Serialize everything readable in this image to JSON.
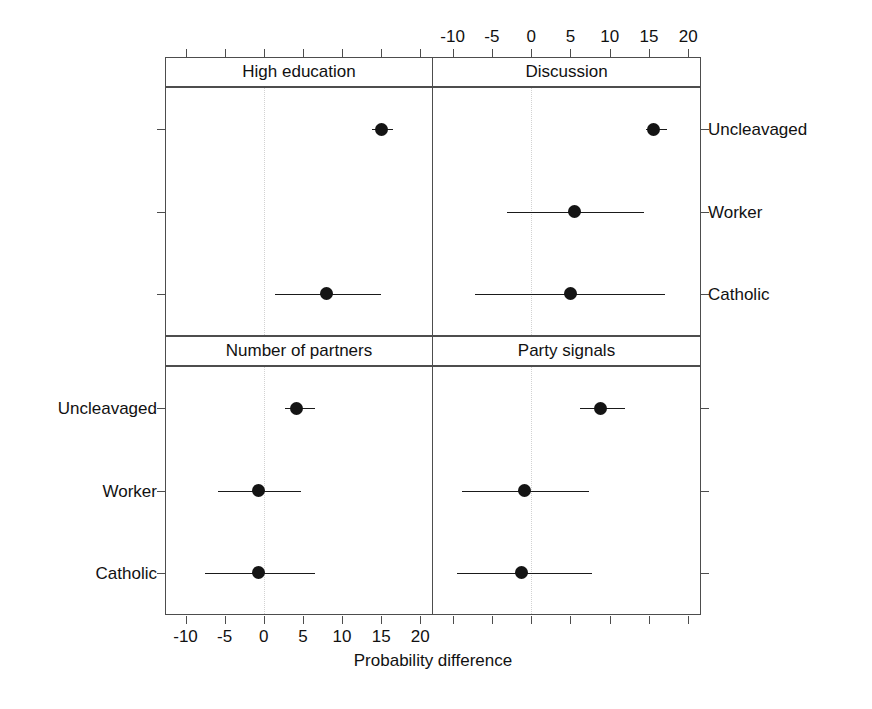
{
  "chart_data": {
    "type": "scatter",
    "plot_style": "dot-plot with horizontal confidence-interval whiskers, 2x2 trellis panels",
    "title": "",
    "xlabel": "Probability difference",
    "ylabel": "",
    "xlim": [
      -12.5,
      21.5
    ],
    "xticks": [
      -10,
      -5,
      0,
      5,
      10,
      15,
      20
    ],
    "xtick_labels": [
      "-10",
      "-5",
      "0",
      "5",
      "10",
      "15",
      "20"
    ],
    "categories": [
      "Uncleavaged",
      "Worker",
      "Catholic"
    ],
    "grid": "dotted vertical reference line at x = 0",
    "legend": "none",
    "axis_label_placement": {
      "top_axis_labels_panel": "Discussion",
      "bottom_axis_labels_panel": "Number of partners",
      "right_y_labels_row": "top panels",
      "left_y_labels_row": "bottom panels"
    },
    "panels": [
      {
        "name": "High education",
        "position": "top-left",
        "points": [
          {
            "category": "Uncleavaged",
            "value": 15.0,
            "ci_low": 13.8,
            "ci_high": 16.5
          },
          {
            "category": "Worker",
            "value": null,
            "ci_low": null,
            "ci_high": null
          },
          {
            "category": "Catholic",
            "value": 8.0,
            "ci_low": 1.4,
            "ci_high": 15.0
          }
        ]
      },
      {
        "name": "Discussion",
        "position": "top-right",
        "points": [
          {
            "category": "Uncleavaged",
            "value": 15.6,
            "ci_low": 14.6,
            "ci_high": 17.3
          },
          {
            "category": "Worker",
            "value": 5.5,
            "ci_low": -3.1,
            "ci_high": 14.4
          },
          {
            "category": "Catholic",
            "value": 5.0,
            "ci_low": -7.1,
            "ci_high": 17.0
          }
        ]
      },
      {
        "name": "Number of partners",
        "position": "bottom-left",
        "points": [
          {
            "category": "Uncleavaged",
            "value": 4.2,
            "ci_low": 2.7,
            "ci_high": 6.5
          },
          {
            "category": "Worker",
            "value": -0.7,
            "ci_low": -5.8,
            "ci_high": 4.7
          },
          {
            "category": "Catholic",
            "value": -0.7,
            "ci_low": -7.5,
            "ci_high": 6.5
          }
        ]
      },
      {
        "name": "Party signals",
        "position": "bottom-right",
        "points": [
          {
            "category": "Uncleavaged",
            "value": 8.8,
            "ci_low": 6.2,
            "ci_high": 11.9
          },
          {
            "category": "Worker",
            "value": -0.8,
            "ci_low": -8.8,
            "ci_high": 7.4
          },
          {
            "category": "Catholic",
            "value": -1.2,
            "ci_low": -9.5,
            "ci_high": 7.8
          }
        ]
      }
    ],
    "colors": {
      "point": "#141414",
      "whisker": "#1a1a1a",
      "frame": "#4d4d4d",
      "zero_reference": "#d2d2d2",
      "background": "#ffffff",
      "text": "#111111"
    }
  },
  "strips": {
    "top_left": "High education",
    "top_right": "Discussion",
    "bottom_left": "Number of partners",
    "bottom_right": "Party signals"
  },
  "axis": {
    "x_title": "Probability difference",
    "ticks": [
      "-10",
      "-5",
      "0",
      "5",
      "10",
      "15",
      "20"
    ]
  },
  "rows": {
    "uncleavaged": "Uncleavaged",
    "worker": "Worker",
    "catholic": "Catholic"
  }
}
